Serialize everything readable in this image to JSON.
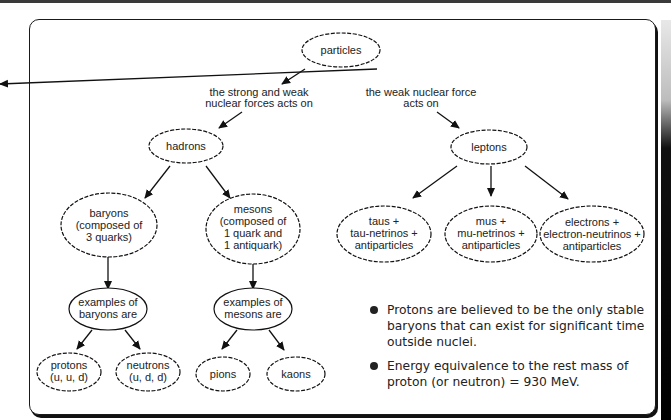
{
  "diagram": {
    "root": {
      "label": "particles"
    },
    "edge_labels": {
      "left": [
        "the strong and weak",
        "nuclear forces acts on"
      ],
      "right": [
        "the weak nuclear force",
        "acts on"
      ]
    },
    "hadrons": {
      "label": "hadrons"
    },
    "leptons": {
      "label": "leptons"
    },
    "baryons": {
      "lines": [
        "baryons",
        "(composed of",
        "3 quarks)"
      ]
    },
    "mesons": {
      "lines": [
        "mesons",
        "(composed of",
        "1 quark and",
        "1 antiquark)"
      ]
    },
    "baryon_examples": {
      "lines": [
        "examples of",
        "baryons are"
      ]
    },
    "meson_examples": {
      "lines": [
        "examples of",
        "mesons are"
      ]
    },
    "protons": {
      "lines": [
        "protons",
        "(u, u, d)"
      ]
    },
    "neutrons": {
      "lines": [
        "neutrons",
        "(u, d, d)"
      ]
    },
    "pions": {
      "label": "pions"
    },
    "kaons": {
      "label": "kaons"
    },
    "taus": {
      "lines": [
        "taus +",
        "tau-netrinos +",
        "antiparticles"
      ]
    },
    "mus": {
      "lines": [
        "mus +",
        "mu-netrinos +",
        "antiparticles"
      ]
    },
    "electrons": {
      "lines": [
        "electrons +",
        "electron-neutrinos +",
        "antiparticles"
      ]
    }
  },
  "notes": [
    "Protons are believed to be the only stable baryons that can exist for significant time outside nuclei.",
    "Energy equivalence to the rest mass of proton (or neutron) = 930 MeV."
  ],
  "colors": {
    "ink": "#222222",
    "background": "#ffffff"
  }
}
